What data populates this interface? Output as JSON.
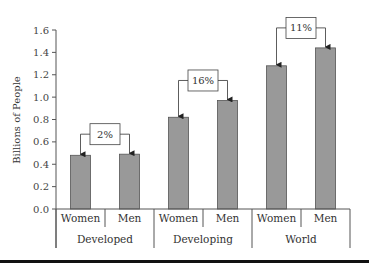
{
  "chart_data": {
    "type": "bar",
    "title": "",
    "xlabel": "",
    "ylabel": "Billions of People",
    "ylim": [
      0,
      1.6
    ],
    "yticks": [
      "0.0",
      "0.2",
      "0.4",
      "0.6",
      "0.8",
      "1.0",
      "1.2",
      "1.4",
      "1.6"
    ],
    "grid": false,
    "legend": null,
    "groups": [
      "Developed",
      "Developing",
      "World"
    ],
    "categories": [
      "Women",
      "Men"
    ],
    "bars": [
      {
        "group": "Developed",
        "category": "Women",
        "value": 0.48
      },
      {
        "group": "Developed",
        "category": "Men",
        "value": 0.49
      },
      {
        "group": "Developing",
        "category": "Women",
        "value": 0.82
      },
      {
        "group": "Developing",
        "category": "Men",
        "value": 0.97
      },
      {
        "group": "World",
        "category": "Women",
        "value": 1.28
      },
      {
        "group": "World",
        "category": "Men",
        "value": 1.44
      }
    ],
    "annotations": [
      {
        "group": "Developed",
        "text": "2%"
      },
      {
        "group": "Developing",
        "text": "16%"
      },
      {
        "group": "World",
        "text": "11%"
      }
    ],
    "bar_color": "#999999"
  }
}
